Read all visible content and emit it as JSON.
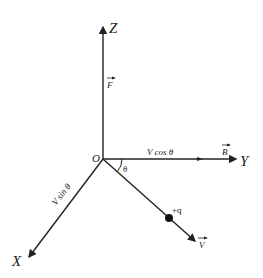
{
  "diagram": {
    "axes": {
      "z_label": "Z",
      "y_label": "Y",
      "x_label": "X",
      "origin_label": "O"
    },
    "vectors": {
      "force_label": "F",
      "field_label": "B",
      "velocity_label": "V"
    },
    "components": {
      "y_component": "V cos θ",
      "x_component": "V sin θ"
    },
    "angle_label": "θ",
    "charge_label": "+q",
    "colors": {
      "line": "#222222",
      "background": "#ffffff"
    }
  }
}
